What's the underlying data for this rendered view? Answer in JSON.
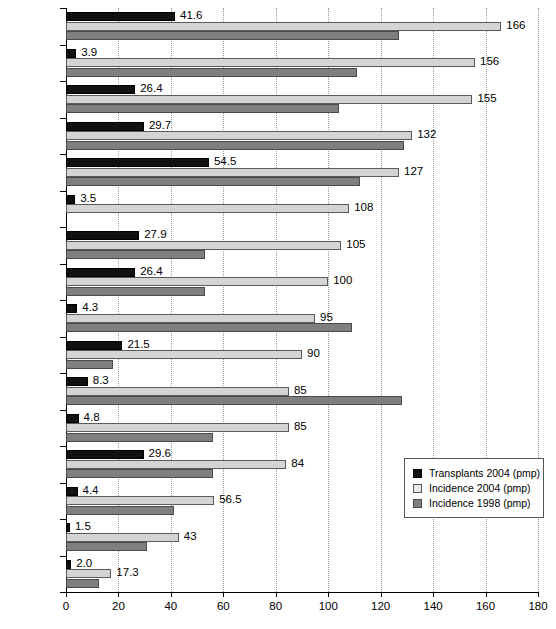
{
  "chart_data": {
    "type": "bar",
    "orientation": "horizontal",
    "title": "",
    "xlabel": "",
    "ylabel": "",
    "xlim": [
      0,
      180
    ],
    "xticks": [
      0,
      20,
      40,
      60,
      80,
      100,
      120,
      140,
      160,
      180
    ],
    "grid": "vertical-dotted",
    "legend_position": "inside-right-lower",
    "categories": [
      "Czech Rep.",
      "Slovakia",
      "Croatia",
      "Hungary",
      "Slovenia",
      "Bosnia",
      "Poland",
      "Latvia",
      "Serbia",
      "Lithuania",
      "Macedonia",
      "Bulgaria",
      "Estonia",
      "Romania",
      "Byelorussia",
      "Russia"
    ],
    "series": [
      {
        "name": "Transplants 2004 (pmp)",
        "color": "#111111",
        "values": [
          41.6,
          3.9,
          26.4,
          29.7,
          54.5,
          3.5,
          27.9,
          26.4,
          4.3,
          21.5,
          8.3,
          4.8,
          29.6,
          4.4,
          1.5,
          2.0
        ],
        "labels": [
          "41.6",
          "3.9",
          "26.4",
          "29.7",
          "54.5",
          "3.5",
          "27.9",
          "26.4",
          "4.3",
          "21.5",
          "8.3",
          "4.8",
          "29.6",
          "4.4",
          "1.5",
          "2.0"
        ]
      },
      {
        "name": "Incidence 2004 (pmp)",
        "color": "#d4d4d4",
        "values": [
          166,
          156,
          155,
          132,
          127,
          108,
          105,
          100,
          95,
          90,
          85,
          85,
          84,
          56.5,
          43,
          17.3
        ],
        "labels": [
          "166",
          "156",
          "155",
          "132",
          "127",
          "108",
          "105",
          "100",
          "95",
          "90",
          "85",
          "85",
          "84",
          "56.5",
          "43",
          "17.3"
        ]
      },
      {
        "name": "Incidence 1998 (pmp)",
        "color": "#7f7f7f",
        "values": [
          127,
          111,
          104,
          129,
          112,
          0,
          53,
          53,
          109,
          18,
          128,
          56,
          56,
          41,
          31,
          12.5
        ],
        "labels": [
          "",
          "",
          "",
          "",
          "",
          "",
          "",
          "",
          "",
          "",
          "",
          "",
          "",
          "",
          "",
          ""
        ]
      }
    ]
  },
  "legend": {
    "entries": [
      "Transplants 2004 (pmp)",
      "Incidence 2004 (pmp)",
      "Incidence 1998 (pmp)"
    ]
  },
  "caption": ""
}
